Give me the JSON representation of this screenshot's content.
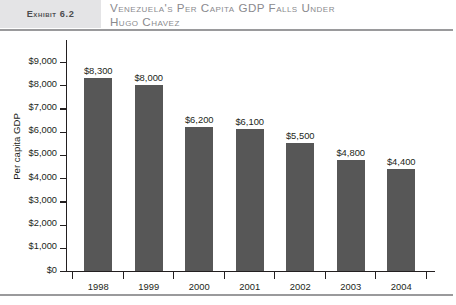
{
  "header": {
    "exhibit_label": "Exhibit 6.2",
    "title": "Venezuela's Per Capita GDP Falls Under\nHugo Chavez",
    "exhibit_box_color": "#e4e4e6",
    "title_color": "#8a8a8e",
    "rule_color": "#9a9a9c"
  },
  "chart_data": {
    "type": "bar",
    "title": "Venezuela's Per Capita GDP Falls Under Hugo Chavez",
    "xlabel": "",
    "ylabel": "Per capita GDP",
    "categories": [
      "1998",
      "1999",
      "2000",
      "2001",
      "2002",
      "2003",
      "2004"
    ],
    "values": [
      8300,
      8000,
      6200,
      6100,
      5500,
      4800,
      4400
    ],
    "value_labels": [
      "$8,300",
      "$8,000",
      "$6,200",
      "$6,100",
      "$5,500",
      "$4,800",
      "$4,400"
    ],
    "ylim": [
      0,
      9000
    ],
    "ytick_values": [
      0,
      1000,
      2000,
      3000,
      4000,
      5000,
      6000,
      7000,
      8000,
      9000
    ],
    "ytick_labels": [
      "$0",
      "$1,000",
      "$2,000",
      "$3,000",
      "$4,000",
      "$5,000",
      "$6,000",
      "$7,000",
      "$8,000",
      "$9,000"
    ],
    "grid": false,
    "legend": false,
    "bar_color": "#575757",
    "axis_color": "#231f20"
  }
}
